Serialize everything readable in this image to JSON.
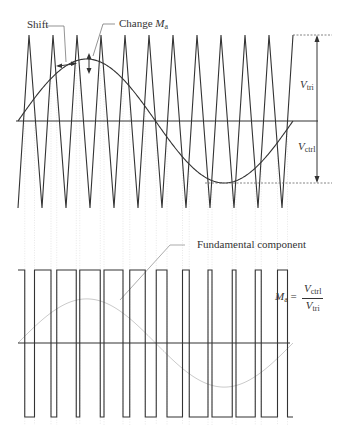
{
  "labels": {
    "shift": "Shift",
    "change": "Change",
    "change_var": "M",
    "change_sub": "a",
    "v_tri": "V",
    "v_tri_sub": "tri",
    "v_ctrl": "V",
    "v_ctrl_sub": "ctrl",
    "fundamental": "Fundamental component",
    "formula_lhs": "M",
    "formula_lhs_sub": "a",
    "formula_eq": "=",
    "formula_num": "V",
    "formula_num_sub": "ctrl",
    "formula_den": "V",
    "formula_den_sub": "tri"
  },
  "colors": {
    "line": "#333333",
    "guide": "#cccccc",
    "fundamental": "#bbbbbb"
  },
  "carrier": {
    "peaks_x": [
      29,
      53,
      77,
      101,
      125,
      149,
      173,
      197,
      221,
      245,
      269,
      293
    ],
    "troughs_x": [
      18,
      42,
      66,
      90,
      114,
      138,
      162,
      186,
      210,
      234,
      258,
      282
    ],
    "top_y": 35,
    "bottom_y": 208
  },
  "control": {
    "axis_y": 121,
    "amplitude": 62,
    "x_start": 18,
    "x_end": 293
  },
  "pwm": {
    "high_y": 270,
    "low_y": 417,
    "axis_y": 343
  }
}
